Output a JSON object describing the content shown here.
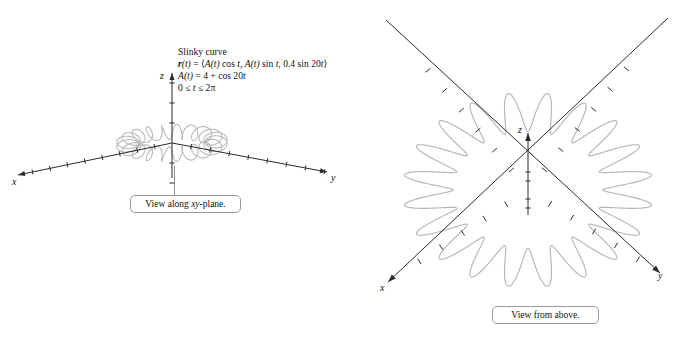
{
  "figure": {
    "title": "Slinky curve",
    "equation_lines": [
      "r(t) = ⟨A(t) cos t, A(t) sin t, 0.4 sin 20t⟩",
      "A(t) = 4 + cos 20t",
      "0 ≤ t ≤ 2π"
    ],
    "curve_color": "#b6b6b6",
    "axis_color": "#2b2b2b",
    "background_color": "#ffffff"
  },
  "panels": [
    {
      "id": "left",
      "caption": "View along xy-plane.",
      "view": "xy-plane",
      "axes": [
        {
          "name": "x",
          "label": "x",
          "label_x": 12,
          "label_y": 182
        },
        {
          "name": "z",
          "label": "z",
          "label_x": 160,
          "label_y": 76
        },
        {
          "name": "y",
          "label": "y",
          "label_x": 330,
          "label_y": 178
        }
      ]
    },
    {
      "id": "right",
      "caption": "View from above.",
      "view": "above",
      "axes": [
        {
          "name": "x",
          "label": "x",
          "label_x": 12,
          "label_y": 290
        },
        {
          "name": "z",
          "label": "z",
          "label_x": 152,
          "label_y": 130
        },
        {
          "name": "y",
          "label": "y",
          "label_x": 290,
          "label_y": 278
        }
      ]
    }
  ],
  "chart_data": {
    "type": "line",
    "title": "Slinky curve",
    "parametric": true,
    "equations": {
      "r": "⟨A(t) cos t, A(t) sin t, 0.4 sin 20t⟩",
      "A": "4 + cos 20t",
      "domain": "0 ≤ t ≤ 2π"
    },
    "parameters": {
      "amplitude_base": 4,
      "amplitude_ripple": 1,
      "ripple_frequency": 20,
      "z_amplitude": 0.4,
      "z_frequency": 20,
      "t_min": 0,
      "t_max": 6.283185307179586,
      "samples": 3000
    },
    "xlabel": "x",
    "ylabel": "y",
    "zlabel": "z",
    "views": [
      {
        "name": "View along xy-plane.",
        "projection": "oblique-edge-on",
        "axis_ticks": {
          "x": 8,
          "y": 8,
          "z": 4
        }
      },
      {
        "name": "View from above.",
        "projection": "top-down",
        "axis_ticks": {
          "x": 8,
          "y": 8,
          "z": 2
        }
      }
    ],
    "grid": false,
    "legend": false
  }
}
